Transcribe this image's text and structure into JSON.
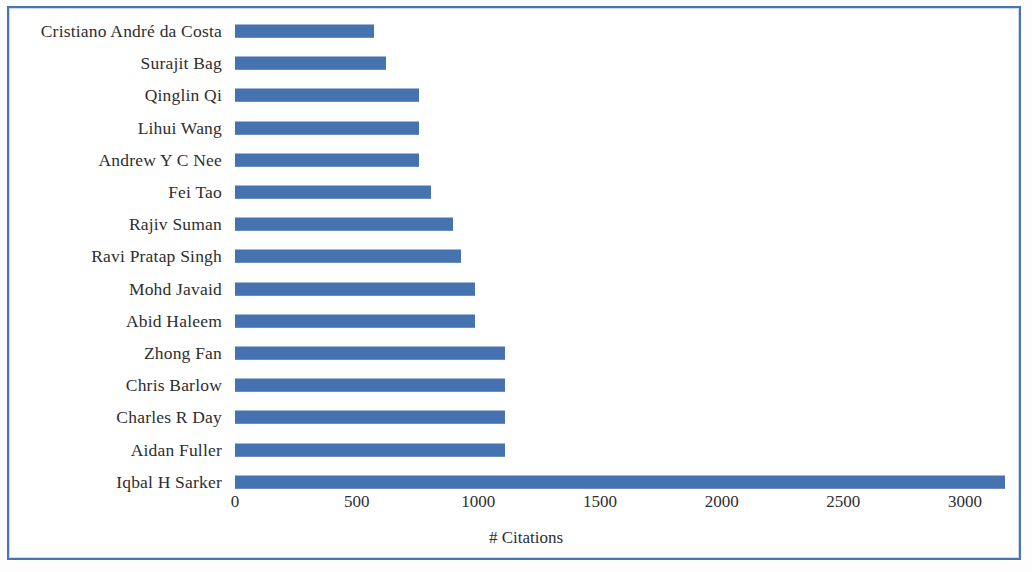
{
  "figure": {
    "border_color": "#4a73b5",
    "background": "#ffffff"
  },
  "chart_data": {
    "type": "bar",
    "orientation": "horizontal",
    "title": "",
    "subtitle": "",
    "xlabel": "# Citations",
    "ylabel": "",
    "series_color": "#4573b0",
    "grid": false,
    "legend": null,
    "xlim": [
      0,
      3250
    ],
    "xticks": [
      "0",
      "500",
      "1000",
      "1500",
      "2000",
      "2500",
      "3000"
    ],
    "xtick_values": [
      0,
      500,
      1000,
      1500,
      2000,
      2500,
      3000
    ],
    "categories": [
      "Cristiano André da Costa",
      "Surajit Bag",
      "Qinglin Qi",
      "Lihui Wang",
      "Andrew Y C Nee",
      "Fei Tao",
      "Rajiv Suman",
      "Ravi Pratap Singh",
      "Mohd Javaid",
      "Abid Haleem",
      "Zhong Fan",
      "Chris Barlow",
      "Charles R Day",
      "Aidan Fuller",
      "Iqbal H Sarker"
    ],
    "values": [
      570,
      620,
      755,
      755,
      755,
      805,
      895,
      930,
      985,
      985,
      1110,
      1110,
      1110,
      1110,
      3165
    ]
  }
}
